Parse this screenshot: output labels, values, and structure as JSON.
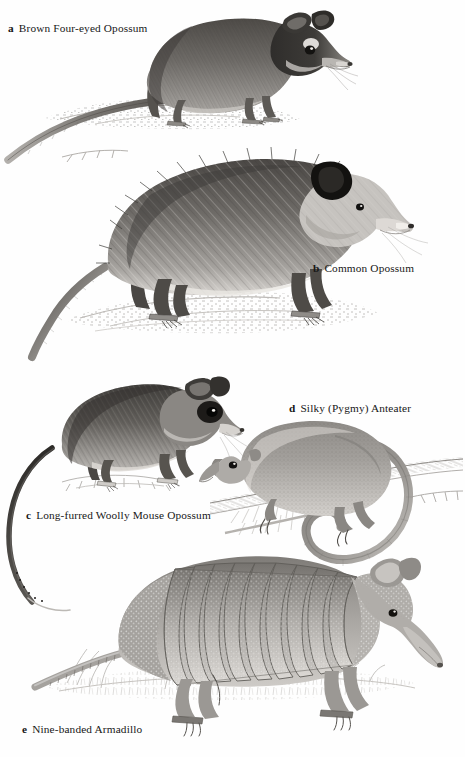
{
  "page": {
    "type": "field-guide-illustration-plate",
    "background_color": "#ffffff",
    "ink_color": "#1a1a1a",
    "style": "grayscale pen-and-ink / graphite natural history illustrations",
    "width": 465,
    "height": 757
  },
  "figures": [
    {
      "key": "a",
      "label": "Brown Four-eyed Opossum",
      "caption": "Brown Four-eyed Opossum",
      "position": "top",
      "description": "Opossum in left profile standing on a rock, long scaly tail trailing to lower left, pale spots above the eyes, large rounded ears",
      "tone": "#6d6a66"
    },
    {
      "key": "b",
      "label": "Common Opossum",
      "caption": "Common Opossum",
      "position": "upper-middle",
      "description": "Large shaggy opossum in right-facing profile on a rock, coarse guard hairs, white face, naked tail curving down to the left",
      "tone": "#75726e"
    },
    {
      "key": "c",
      "label": "Long-furred Woolly Mouse Opossum",
      "caption": "Long-furred Woolly Mouse Opossum",
      "position": "middle-left",
      "description": "Small mouse opossum on a tuft of grass, dark eye-ring mask, very long thin tail sweeping in a wide arc below and to the left",
      "tone": "#64615d"
    },
    {
      "key": "d",
      "label": "Silky (Pygmy) Anteater",
      "caption": "Silky (Pygmy) Anteater",
      "position": "middle-right",
      "description": "Silky anteater clinging to a diagonal branch, short tapered snout, dense soft fur, prehensile tail curled in a loop beneath the branch",
      "tone": "#807d79"
    },
    {
      "key": "e",
      "label": "Nine-banded Armadillo",
      "caption": "Nine-banded Armadillo",
      "position": "bottom",
      "description": "Armadillo in right-facing profile standing in grass, banded carapace with nine movable bands, long tapering ringed tail, large upright ears",
      "tone": "#8a8783"
    }
  ]
}
